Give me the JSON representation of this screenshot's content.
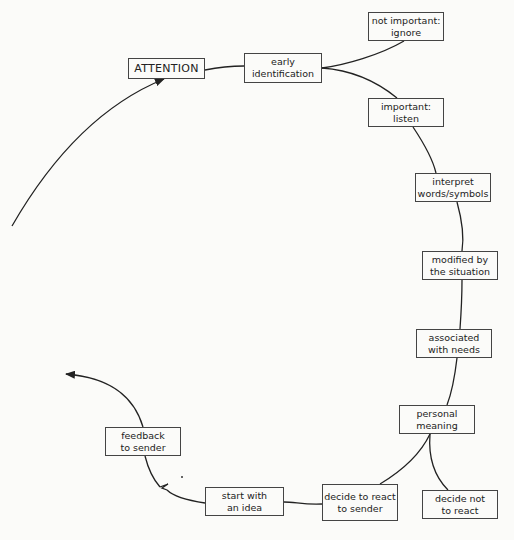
{
  "diagram": {
    "nodes": [
      {
        "id": "attention",
        "lines": [
          "ATTENTION"
        ],
        "x": 128,
        "y": 58,
        "w": 77,
        "h": 21
      },
      {
        "id": "early-identification",
        "lines": [
          "early",
          "identification"
        ],
        "x": 244,
        "y": 53,
        "w": 78,
        "h": 30
      },
      {
        "id": "not-important-ignore",
        "lines": [
          "not important:",
          "ignore"
        ],
        "x": 368,
        "y": 12,
        "w": 76,
        "h": 29
      },
      {
        "id": "important-listen",
        "lines": [
          "important:",
          "listen"
        ],
        "x": 368,
        "y": 98,
        "w": 76,
        "h": 29
      },
      {
        "id": "interpret-words-symbols",
        "lines": [
          "interpret",
          "words/symbols"
        ],
        "x": 415,
        "y": 173,
        "w": 76,
        "h": 29
      },
      {
        "id": "modified-by-situation",
        "lines": [
          "modified by",
          "the situation"
        ],
        "x": 422,
        "y": 251,
        "w": 76,
        "h": 29
      },
      {
        "id": "associated-with-needs",
        "lines": [
          "associated",
          "with needs"
        ],
        "x": 416,
        "y": 329,
        "w": 76,
        "h": 29
      },
      {
        "id": "personal-meaning",
        "lines": [
          "personal",
          "meaning"
        ],
        "x": 399,
        "y": 405,
        "w": 76,
        "h": 29
      },
      {
        "id": "decide-not-to-react",
        "lines": [
          "decide not",
          "to react"
        ],
        "x": 422,
        "y": 490,
        "w": 76,
        "h": 29
      },
      {
        "id": "decide-to-react",
        "lines": [
          "decide to react",
          "to sender"
        ],
        "x": 322,
        "y": 484,
        "w": 76,
        "h": 37
      },
      {
        "id": "start-with-idea",
        "lines": [
          "start with",
          "an idea"
        ],
        "x": 205,
        "y": 487,
        "w": 79,
        "h": 29
      },
      {
        "id": "feedback-to-sender",
        "lines": [
          "feedback",
          "to sender"
        ],
        "x": 105,
        "y": 427,
        "w": 76,
        "h": 29
      }
    ],
    "colors": {
      "line": "#222222",
      "border": "#444444",
      "background": "#fbfbf9",
      "text": "#222222"
    }
  }
}
